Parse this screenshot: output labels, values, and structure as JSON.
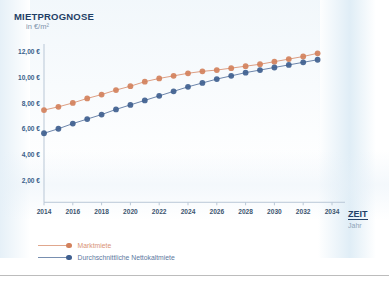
{
  "chart_data": {
    "type": "line",
    "title": "MIETPROGNOSE",
    "subtitle": "in €/m²",
    "xlabel": "ZEIT",
    "xlabel_sub": "Jahr",
    "ylabel": "in €/m²",
    "xlim": [
      2014,
      2034
    ],
    "ylim": [
      0,
      13
    ],
    "grid": false,
    "legend_position": "bottom-left",
    "x": [
      2014,
      2015,
      2016,
      2017,
      2018,
      2019,
      2020,
      2021,
      2022,
      2023,
      2024,
      2025,
      2026,
      2027,
      2028,
      2029,
      2030,
      2031,
      2032,
      2033
    ],
    "xticks": [
      "2014",
      "2016",
      "2018",
      "2020",
      "2022",
      "2024",
      "2026",
      "2028",
      "2030",
      "2032",
      "2034"
    ],
    "xtick_values": [
      2014,
      2016,
      2018,
      2020,
      2022,
      2024,
      2026,
      2028,
      2030,
      2032,
      2034
    ],
    "yticks": [
      "2,00 €",
      "4,00 €",
      "6,00 €",
      "8,00 €",
      "10,00 €",
      "12,00 €"
    ],
    "ytick_values": [
      2,
      4,
      6,
      8,
      10,
      12
    ],
    "series": [
      {
        "name": "Marktmiete",
        "color": "#d3815c",
        "values": [
          7.5,
          7.75,
          8.05,
          8.4,
          8.7,
          9.05,
          9.35,
          9.7,
          9.95,
          10.15,
          10.35,
          10.5,
          10.6,
          10.75,
          10.9,
          11.05,
          11.25,
          11.45,
          11.65,
          11.9
        ]
      },
      {
        "name": "Durchschnittliche Nettokaltmiete",
        "color": "#3f5f8f",
        "values": [
          5.7,
          6.05,
          6.45,
          6.8,
          7.15,
          7.55,
          7.9,
          8.25,
          8.6,
          8.95,
          9.3,
          9.6,
          9.9,
          10.15,
          10.4,
          10.6,
          10.8,
          11.0,
          11.2,
          11.4
        ]
      }
    ]
  },
  "legend": {
    "items": [
      {
        "label": "Marktmiete",
        "color": "#d3815c"
      },
      {
        "label": "Durchschnittliche Nettokaltmiete",
        "color": "#3f5f8f"
      }
    ]
  }
}
